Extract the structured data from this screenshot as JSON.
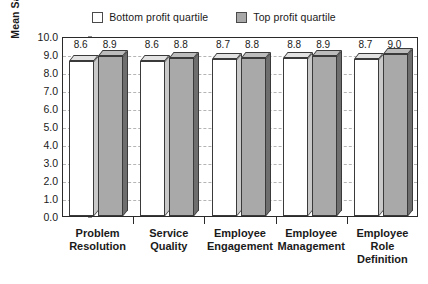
{
  "chart_data": {
    "type": "bar",
    "title": "",
    "subtitle": "",
    "xlabel": "",
    "ylabel": "Mean Satisfaction Rating",
    "ylim": [
      0.0,
      10.0
    ],
    "ytick_step": 1.0,
    "ytick_labels": [
      "10.0",
      "9.0",
      "8.0",
      "7.0",
      "6.0",
      "5.0",
      "4.0",
      "3.0",
      "2.0",
      "1.0",
      "0.0"
    ],
    "ytick_values": [
      10.0,
      9.0,
      8.0,
      7.0,
      6.0,
      5.0,
      4.0,
      3.0,
      2.0,
      1.0,
      0.0
    ],
    "grid": true,
    "grid_style": "dashed-horizontal",
    "legend_position": "top-center",
    "categories": [
      "Problem Resolution",
      "Service Quality",
      "Employee Engagement",
      "Employee Management",
      "Employee Role Definition"
    ],
    "category_lines": [
      [
        "Problem",
        "Resolution"
      ],
      [
        "Service",
        "Quality"
      ],
      [
        "Employee",
        "Engagement"
      ],
      [
        "Employee",
        "Management"
      ],
      [
        "Employee",
        "Role",
        "Definition"
      ]
    ],
    "series": [
      {
        "name": "Bottom profit quartile",
        "color": "#ffffff",
        "values": [
          8.6,
          8.6,
          8.7,
          8.8,
          8.7
        ],
        "labels": [
          "8.6",
          "8.6",
          "8.7",
          "8.8",
          "8.7"
        ]
      },
      {
        "name": "Top profit quartile",
        "color": "#a9a9a9",
        "values": [
          8.9,
          8.8,
          8.8,
          8.9,
          9.0
        ],
        "labels": [
          "8.9",
          "8.8",
          "8.8",
          "8.9",
          "9.0"
        ]
      }
    ]
  },
  "legend": {
    "items": [
      {
        "label": "Bottom profit quartile",
        "swatch": "bottom"
      },
      {
        "label": "Top profit quartile",
        "swatch": "top"
      }
    ]
  },
  "colors": {
    "bar_bottom_face": "#ffffff",
    "bar_top_face": "#a9a9a9",
    "axis": "#2a2a2a",
    "grid": "#b5b5b5",
    "text": "#1a1a1a",
    "background": "#ffffff"
  }
}
